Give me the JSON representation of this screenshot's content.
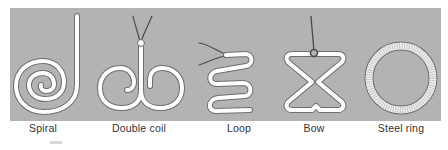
{
  "figure": {
    "panel_color": "#b3b3b3",
    "device_color": "#ffffff",
    "outline_color": "#6e6e6e",
    "thread_color": "#4a4a4a",
    "items": [
      {
        "id": "spiral",
        "label": "Spiral",
        "center_x": 43
      },
      {
        "id": "double-coil",
        "label": "Double coil",
        "center_x": 139
      },
      {
        "id": "loop",
        "label": "Loop",
        "center_x": 239
      },
      {
        "id": "bow",
        "label": "Bow",
        "center_x": 314
      },
      {
        "id": "steel-ring",
        "label": "Steel ring",
        "center_x": 401
      }
    ]
  }
}
